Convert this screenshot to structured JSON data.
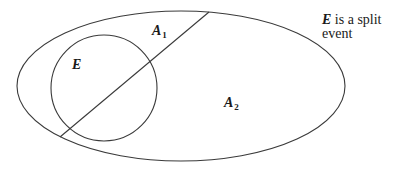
{
  "diagram": {
    "type": "venn-partition",
    "outer_set": {
      "shape": "ellipse",
      "cx": 181,
      "cy": 86,
      "rx": 164,
      "ry": 75
    },
    "event_circle": {
      "shape": "circle",
      "cx": 104,
      "cy": 88,
      "r": 53
    },
    "split_line": {
      "x1": 209,
      "y1": 12,
      "x2": 60,
      "y2": 137
    },
    "stroke_color": "#3a3a3a",
    "labels": {
      "event": {
        "main": "E",
        "sub": ""
      },
      "a1": {
        "main": "A",
        "sub": "1"
      },
      "a2": {
        "main": "A",
        "sub": "2"
      }
    },
    "caption": {
      "emphasis": "E",
      "line1_rest": " is a split",
      "line2": "event"
    }
  }
}
